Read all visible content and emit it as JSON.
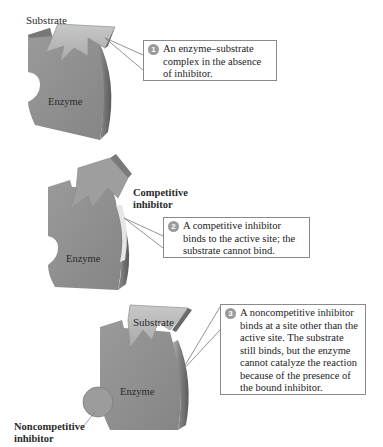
{
  "panels": [
    {
      "step": "1",
      "enzyme_label": "Enzyme",
      "substrate_label": "Substrate",
      "caption": "An enzyme–substrate complex in the absence of inhibitor."
    },
    {
      "step": "2",
      "enzyme_label": "Enzyme",
      "inhibitor_label_line1": "Competitive",
      "inhibitor_label_line2": "inhibitor",
      "caption": "A competitive inhibitor binds to the active site; the substrate cannot bind."
    },
    {
      "step": "3",
      "enzyme_label": "Enzyme",
      "substrate_label": "Substrate",
      "inhibitor_label_line1": "Noncompetitive",
      "inhibitor_label_line2": "inhibitor",
      "caption": "A noncompetitive inhibitor binds at a site other than the active site. The substrate still binds, but the enzyme cannot catalyze the reaction because of the presence of the bound inhibitor."
    }
  ],
  "colors": {
    "enzyme_face": "#8f8f8f",
    "enzyme_side": "#6e6e6e",
    "substrate_face": "#bdbdbd",
    "inhibitor_face": "#9c9c9c",
    "callout_border": "#8a8a8a",
    "number_badge": "#9a9a9a"
  }
}
